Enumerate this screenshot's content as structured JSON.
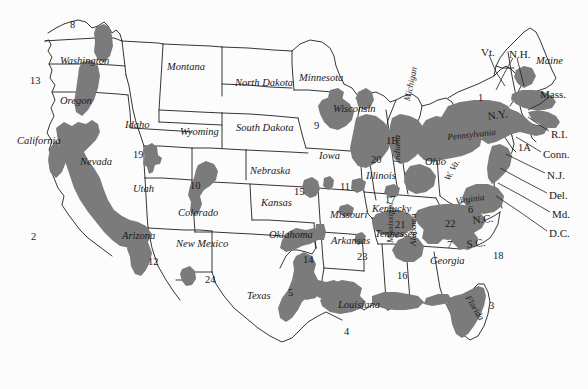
{
  "map": {
    "title": "United States shaded-region map with numbered districts",
    "colors": {
      "background": "#fcfcfc",
      "shading": "#7b7b7b",
      "border": "#1f1f1f",
      "text": "#1a1a1a"
    },
    "state_names": [
      {
        "name": "Washington",
        "x": 60,
        "y": 56,
        "rot": 0,
        "size": "reg"
      },
      {
        "name": "Oregon",
        "x": 60,
        "y": 96,
        "rot": 0,
        "size": "reg"
      },
      {
        "name": "California",
        "x": 17,
        "y": 136,
        "rot": 0,
        "size": "reg"
      },
      {
        "name": "Nevada",
        "x": 80,
        "y": 157,
        "rot": 0,
        "size": "reg"
      },
      {
        "name": "Idaho",
        "x": 125,
        "y": 120,
        "rot": 0,
        "size": "reg"
      },
      {
        "name": "Montana",
        "x": 167,
        "y": 62,
        "rot": 0,
        "size": "reg"
      },
      {
        "name": "Wyoming",
        "x": 180,
        "y": 127,
        "rot": 0,
        "size": "reg"
      },
      {
        "name": "Utah",
        "x": 133,
        "y": 184,
        "rot": 0,
        "size": "reg"
      },
      {
        "name": "Arizona",
        "x": 122,
        "y": 231,
        "rot": 0,
        "size": "reg"
      },
      {
        "name": "Colorado",
        "x": 178,
        "y": 208,
        "rot": 0,
        "size": "reg"
      },
      {
        "name": "New Mexico",
        "x": 176,
        "y": 239,
        "rot": 0,
        "size": "reg"
      },
      {
        "name": "North Dakota",
        "x": 235,
        "y": 78,
        "rot": 0,
        "size": "reg"
      },
      {
        "name": "South Dakota",
        "x": 236,
        "y": 123,
        "rot": 0,
        "size": "reg"
      },
      {
        "name": "Nebraska",
        "x": 250,
        "y": 166,
        "rot": 0,
        "size": "reg"
      },
      {
        "name": "Kansas",
        "x": 261,
        "y": 198,
        "rot": 0,
        "size": "reg"
      },
      {
        "name": "Oklahoma",
        "x": 269,
        "y": 230,
        "rot": 0,
        "size": "reg"
      },
      {
        "name": "Texas",
        "x": 247,
        "y": 291,
        "rot": 0,
        "size": "reg"
      },
      {
        "name": "Minnesota",
        "x": 299,
        "y": 73,
        "rot": 0,
        "size": "reg"
      },
      {
        "name": "Iowa",
        "x": 319,
        "y": 151,
        "rot": 0,
        "size": "reg"
      },
      {
        "name": "Missouri",
        "x": 330,
        "y": 210,
        "rot": 0,
        "size": "reg"
      },
      {
        "name": "Arkansas",
        "x": 331,
        "y": 236,
        "rot": 0,
        "size": "reg"
      },
      {
        "name": "Wisconsin",
        "x": 333,
        "y": 104,
        "rot": 0,
        "size": "reg"
      },
      {
        "name": "Illinois",
        "x": 366,
        "y": 171,
        "rot": 0,
        "size": "reg"
      },
      {
        "name": "Louisiana",
        "x": 338,
        "y": 300,
        "rot": 0,
        "size": "reg"
      },
      {
        "name": "Kentucky",
        "x": 372,
        "y": 204,
        "rot": 0,
        "size": "reg"
      },
      {
        "name": "Tennessee",
        "x": 375,
        "y": 229,
        "rot": 0,
        "size": "reg"
      },
      {
        "name": "Ohio",
        "x": 425,
        "y": 157,
        "rot": 0,
        "size": "reg"
      },
      {
        "name": "Georgia",
        "x": 430,
        "y": 256,
        "rot": 0,
        "size": "reg"
      },
      {
        "name": "Indiana",
        "x": 393,
        "y": 163,
        "rot": -90,
        "size": "sm"
      },
      {
        "name": "Michigan",
        "x": 403,
        "y": 100,
        "rot": -78,
        "size": "sm"
      },
      {
        "name": "Mississippi",
        "x": 386,
        "y": 243,
        "rot": -90,
        "size": "sm"
      },
      {
        "name": "Alabama",
        "x": 409,
        "y": 246,
        "rot": -90,
        "size": "sm"
      },
      {
        "name": "Florida",
        "x": 471,
        "y": 294,
        "rot": 58,
        "size": "sm"
      },
      {
        "name": "Pennsylvania",
        "x": 447,
        "y": 133,
        "rot": -6,
        "size": "sm"
      },
      {
        "name": "W. Va.",
        "x": 443,
        "y": 178,
        "rot": -62,
        "size": "sm"
      },
      {
        "name": "Virginia",
        "x": 455,
        "y": 197,
        "rot": -8,
        "size": "sm"
      },
      {
        "name": "Maine",
        "x": 536,
        "y": 56,
        "rot": 0,
        "size": "reg"
      }
    ],
    "abbreviations": [
      {
        "name": "N.Y.",
        "x": 487,
        "y": 111,
        "rot": -8
      },
      {
        "name": "N.C.",
        "x": 472,
        "y": 215,
        "rot": -6
      },
      {
        "name": "S.C.",
        "x": 466,
        "y": 239,
        "rot": -6
      },
      {
        "name": "Vt.",
        "x": 481,
        "y": 47,
        "rot": 0
      },
      {
        "name": "N.H.",
        "x": 509,
        "y": 49,
        "rot": 0
      },
      {
        "name": "Mass.",
        "x": 540,
        "y": 89,
        "rot": 0
      },
      {
        "name": "R.I.",
        "x": 551,
        "y": 129,
        "rot": 0
      },
      {
        "name": "Conn.",
        "x": 543,
        "y": 149,
        "rot": 0
      },
      {
        "name": "N.J.",
        "x": 547,
        "y": 170,
        "rot": 0
      },
      {
        "name": "Del.",
        "x": 549,
        "y": 190,
        "rot": 0
      },
      {
        "name": "Md.",
        "x": 552,
        "y": 209,
        "rot": 0
      },
      {
        "name": "D.C.",
        "x": 549,
        "y": 228,
        "rot": 0
      }
    ],
    "numbers": [
      {
        "value": "8",
        "x": 70,
        "y": 20
      },
      {
        "value": "13",
        "x": 30,
        "y": 76
      },
      {
        "value": "2",
        "x": 31,
        "y": 232
      },
      {
        "value": "19",
        "x": 133,
        "y": 150
      },
      {
        "value": "10",
        "x": 190,
        "y": 181
      },
      {
        "value": "12",
        "x": 148,
        "y": 257
      },
      {
        "value": "24",
        "x": 205,
        "y": 275
      },
      {
        "value": "5",
        "x": 288,
        "y": 288
      },
      {
        "value": "14",
        "x": 303,
        "y": 255
      },
      {
        "value": "23",
        "x": 357,
        "y": 252
      },
      {
        "value": "4",
        "x": 344,
        "y": 327
      },
      {
        "value": "15",
        "x": 294,
        "y": 187
      },
      {
        "value": "11",
        "x": 340,
        "y": 182
      },
      {
        "value": "9",
        "x": 314,
        "y": 121
      },
      {
        "value": "20",
        "x": 371,
        "y": 155
      },
      {
        "value": "1B",
        "x": 386,
        "y": 136
      },
      {
        "value": "1",
        "x": 478,
        "y": 93
      },
      {
        "value": "1A",
        "x": 518,
        "y": 143
      },
      {
        "value": "3",
        "x": 489,
        "y": 301
      },
      {
        "value": "18",
        "x": 493,
        "y": 251
      },
      {
        "value": "7",
        "x": 447,
        "y": 240
      },
      {
        "value": "6",
        "x": 468,
        "y": 205
      },
      {
        "value": "22",
        "x": 445,
        "y": 219
      },
      {
        "value": "21",
        "x": 395,
        "y": 220
      },
      {
        "value": "17",
        "x": 385,
        "y": 195
      },
      {
        "value": "16",
        "x": 397,
        "y": 271
      }
    ]
  }
}
